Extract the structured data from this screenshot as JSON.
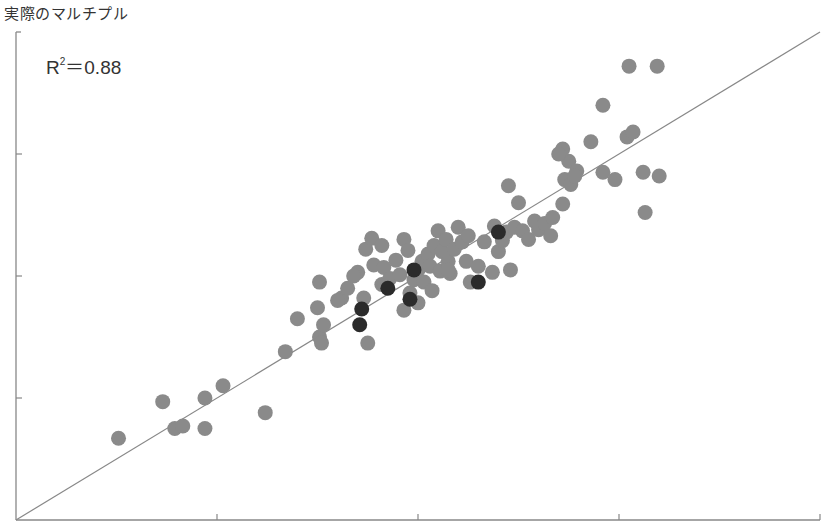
{
  "chart_data": {
    "type": "scatter",
    "title": "",
    "ylabel": "実際のマルチプル",
    "xlabel": "",
    "annotation": "R²＝0.88",
    "r_squared": "0.88",
    "xlim": [
      0,
      4
    ],
    "ylim": [
      0,
      4
    ],
    "x_ticks": [
      1,
      2,
      3,
      4
    ],
    "y_ticks": [
      1,
      2,
      3
    ],
    "tick_labels_visible": false,
    "grid": false,
    "legend": null,
    "reference_line": {
      "type": "fit",
      "from": [
        0,
        0
      ],
      "to": [
        4,
        4
      ]
    },
    "colors": {
      "gray_points": "#8a8a8a",
      "highlight_points": "#2b2b2b",
      "axis": "#888888",
      "line": "#888888"
    },
    "series": [
      {
        "name": "companies",
        "color": "#8a8a8a",
        "points": [
          [
            0.51,
            0.67
          ],
          [
            0.73,
            0.97
          ],
          [
            0.79,
            0.75
          ],
          [
            0.83,
            0.77
          ],
          [
            0.94,
            1.0
          ],
          [
            0.94,
            0.75
          ],
          [
            1.03,
            1.1
          ],
          [
            1.24,
            0.88
          ],
          [
            1.34,
            1.38
          ],
          [
            1.5,
            1.74
          ],
          [
            1.51,
            1.5
          ],
          [
            1.53,
            1.6
          ],
          [
            1.51,
            1.95
          ],
          [
            1.62,
            1.82
          ],
          [
            1.73,
            1.82
          ],
          [
            1.75,
            1.45
          ],
          [
            1.7,
            2.03
          ],
          [
            1.74,
            2.22
          ],
          [
            1.77,
            2.31
          ],
          [
            1.82,
            2.25
          ],
          [
            1.78,
            2.09
          ],
          [
            1.82,
            1.93
          ],
          [
            1.83,
            2.07
          ],
          [
            1.86,
            1.98
          ],
          [
            1.89,
            2.13
          ],
          [
            1.91,
            2.01
          ],
          [
            1.93,
            2.3
          ],
          [
            1.93,
            1.72
          ],
          [
            1.95,
            2.21
          ],
          [
            1.96,
            1.86
          ],
          [
            1.98,
            1.97
          ],
          [
            2.0,
            2.05
          ],
          [
            2.02,
            2.12
          ],
          [
            2.03,
            1.95
          ],
          [
            2.05,
            2.18
          ],
          [
            2.06,
            2.08
          ],
          [
            2.07,
            1.88
          ],
          [
            2.08,
            2.25
          ],
          [
            2.1,
            2.37
          ],
          [
            2.11,
            2.04
          ],
          [
            2.12,
            2.2
          ],
          [
            2.14,
            2.3
          ],
          [
            2.15,
            2.12
          ],
          [
            2.16,
            2.02
          ],
          [
            2.18,
            2.22
          ],
          [
            2.2,
            2.4
          ],
          [
            2.22,
            2.28
          ],
          [
            2.24,
            2.12
          ],
          [
            2.25,
            2.33
          ],
          [
            2.26,
            1.95
          ],
          [
            2.3,
            2.08
          ],
          [
            2.33,
            2.28
          ],
          [
            2.37,
            2.03
          ],
          [
            2.38,
            2.41
          ],
          [
            2.4,
            2.2
          ],
          [
            2.42,
            2.29
          ],
          [
            2.44,
            2.36
          ],
          [
            2.46,
            2.05
          ],
          [
            2.48,
            2.4
          ],
          [
            2.5,
            2.6
          ],
          [
            2.52,
            2.37
          ],
          [
            2.55,
            2.3
          ],
          [
            2.58,
            2.45
          ],
          [
            2.6,
            2.38
          ],
          [
            2.63,
            2.43
          ],
          [
            2.66,
            2.33
          ],
          [
            2.67,
            2.48
          ],
          [
            2.72,
            2.59
          ],
          [
            2.73,
            2.79
          ],
          [
            2.75,
            2.94
          ],
          [
            2.76,
            2.75
          ],
          [
            2.79,
            2.86
          ],
          [
            2.78,
            2.82
          ],
          [
            2.86,
            3.1
          ],
          [
            2.92,
            2.85
          ],
          [
            2.98,
            2.79
          ],
          [
            3.04,
            3.14
          ],
          [
            3.07,
            3.18
          ],
          [
            3.12,
            2.85
          ],
          [
            3.13,
            2.52
          ],
          [
            3.2,
            2.82
          ],
          [
            2.45,
            2.74
          ],
          [
            2.72,
            3.04
          ],
          [
            2.7,
            3.0
          ],
          [
            2.92,
            3.4
          ],
          [
            3.05,
            3.72
          ],
          [
            3.19,
            3.72
          ],
          [
            1.4,
            1.65
          ],
          [
            1.52,
            1.45
          ],
          [
            1.6,
            1.8
          ],
          [
            1.65,
            1.9
          ],
          [
            1.68,
            2.0
          ],
          [
            2.15,
            2.05
          ],
          [
            2.0,
            1.78
          ]
        ]
      },
      {
        "name": "highlighted",
        "color": "#2b2b2b",
        "points": [
          [
            1.72,
            1.73
          ],
          [
            1.71,
            1.6
          ],
          [
            1.85,
            1.9
          ],
          [
            1.96,
            1.81
          ],
          [
            1.98,
            2.05
          ],
          [
            2.3,
            1.95
          ],
          [
            2.4,
            2.36
          ]
        ]
      }
    ]
  }
}
